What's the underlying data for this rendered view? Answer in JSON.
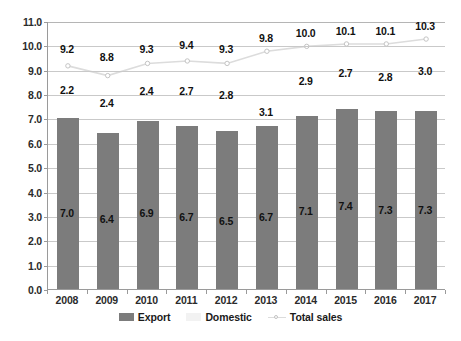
{
  "chart_data": {
    "type": "bar",
    "title": "",
    "subtitle": "",
    "xlabel": "",
    "ylabel": "",
    "categories": [
      "2008",
      "2009",
      "2010",
      "2011",
      "2012",
      "2013",
      "2014",
      "2015",
      "2016",
      "2017"
    ],
    "ylim": [
      0.0,
      11.0
    ],
    "ytick_step": 1.0,
    "ytick_labels": [
      "0.0",
      "1.0",
      "2.0",
      "3.0",
      "4.0",
      "5.0",
      "6.0",
      "7.0",
      "8.0",
      "9.0",
      "10.0",
      "11.0"
    ],
    "ytick_values": [
      0.0,
      1.0,
      2.0,
      3.0,
      4.0,
      5.0,
      6.0,
      7.0,
      8.0,
      9.0,
      10.0,
      11.0
    ],
    "grid": true,
    "legend_position": "bottom",
    "series": [
      {
        "name": "Export",
        "type": "bar",
        "color": "#7c7c7c",
        "values": [
          7.0,
          6.4,
          6.9,
          6.7,
          6.5,
          6.7,
          7.1,
          7.4,
          7.3,
          7.3
        ],
        "labels": [
          "7.0",
          "6.4",
          "6.9",
          "6.7",
          "6.5",
          "6.7",
          "7.1",
          "7.4",
          "7.3",
          "7.3"
        ]
      },
      {
        "name": "Domestic",
        "type": "bar",
        "color": "#f2f2f2",
        "values": [
          2.2,
          2.4,
          2.4,
          2.7,
          2.8,
          3.1,
          2.9,
          2.7,
          2.8,
          3.0
        ],
        "labels": [
          "2.2",
          "2.4",
          "2.4",
          "2.7",
          "2.8",
          "3.1",
          "2.9",
          "2.7",
          "2.8",
          "3.0"
        ]
      },
      {
        "name": "Total sales",
        "type": "line",
        "color": "#dcdcdc",
        "values": [
          9.2,
          8.8,
          9.3,
          9.4,
          9.3,
          9.8,
          10.0,
          10.1,
          10.1,
          10.3
        ],
        "labels": [
          "9.2",
          "8.8",
          "9.3",
          "9.4",
          "9.3",
          "9.8",
          "10.0",
          "10.1",
          "10.1",
          "10.3"
        ]
      }
    ]
  },
  "legend": {
    "items": [
      {
        "label": "Export",
        "marker": "bar-swatch-dark"
      },
      {
        "label": "Domestic",
        "marker": "bar-swatch-light"
      },
      {
        "label": "Total sales",
        "marker": "line-with-circle-marker"
      }
    ]
  }
}
